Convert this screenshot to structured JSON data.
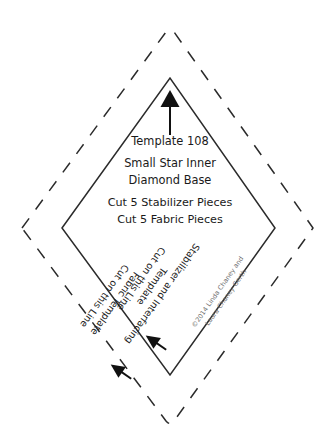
{
  "document": {
    "kind": "quilting-template-pattern-sheet",
    "background_color": "#ffffff",
    "line_color": "#2b2b2b",
    "credit_color": "#6f6f6f"
  },
  "template": {
    "number_label": "Template 108",
    "name_line_1": "Small Star Inner",
    "name_line_2": "Diamond Base",
    "cut_instruction_1": "Cut 5 Stabilizer Pieces",
    "cut_instruction_2": "Cut 5 Fabric Pieces"
  },
  "edge_labels": {
    "inner": {
      "line_1": "Stabilizer and Interfacing",
      "line_2": "Template",
      "line_3": "Cut on this Line"
    },
    "outer": {
      "line_1": "Fabric Template",
      "line_2": "Cut on this Line"
    }
  },
  "credit": {
    "line_1": "©2014 Linda Chaney and",
    "line_2": "Laura Chaney Gerth"
  },
  "icons": {
    "grain_arrow": "up-arrow-icon",
    "inner_cut_pointer": "arrow-down-left-icon",
    "outer_cut_pointer": "arrow-down-left-icon"
  },
  "geometry": {
    "outer_dashed_diamond": "22,228 170,31 313,228 170,424",
    "inner_solid_diamond": "62,228 170,78 275,228 170,375"
  }
}
